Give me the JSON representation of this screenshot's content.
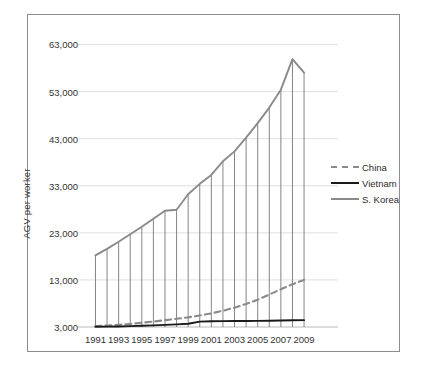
{
  "chart_data": {
    "type": "line",
    "title": "",
    "subtitle": "",
    "xlabel": "",
    "ylabel": "AGV per worker",
    "x": [
      1991,
      1992,
      1993,
      1994,
      1995,
      1996,
      1997,
      1998,
      1999,
      2000,
      2001,
      2002,
      2003,
      2004,
      2005,
      2006,
      2007,
      2008,
      2009
    ],
    "xtick_labels": [
      "1991",
      "1993",
      "1995",
      "1997",
      "1999",
      "2001",
      "2003",
      "2005",
      "2007",
      "2009"
    ],
    "xtick_values": [
      1991,
      1993,
      1995,
      1997,
      1999,
      2001,
      2003,
      2005,
      2007,
      2009
    ],
    "ytick_labels": [
      "3,000",
      "13,000",
      "23,000",
      "33,000",
      "43,000",
      "53,000",
      "63,000"
    ],
    "ytick_values": [
      3000,
      13000,
      23000,
      33000,
      43000,
      53000,
      63000
    ],
    "ylim": [
      3000,
      66500
    ],
    "xlim": [
      1990.4,
      2009.6
    ],
    "grid": "horizontal",
    "legend_position": "right-middle",
    "drop_lines": true,
    "drop_lines_series": "S. Korea",
    "series": [
      {
        "name": "China",
        "style": "dashed",
        "color": "#8a8a8a",
        "values": [
          3200,
          3300,
          3450,
          3650,
          3900,
          4150,
          4450,
          4750,
          5050,
          5450,
          5900,
          6450,
          7100,
          7900,
          8800,
          9900,
          11000,
          12100,
          13000
        ]
      },
      {
        "name": "Vietnam",
        "style": "solid",
        "color": "#1a1a1a",
        "values": [
          3050,
          3080,
          3120,
          3180,
          3260,
          3340,
          3450,
          3560,
          3680,
          4150,
          4220,
          4250,
          4260,
          4270,
          4300,
          4330,
          4380,
          4420,
          4450
        ]
      },
      {
        "name": "S. Korea",
        "style": "solid",
        "color": "#8a8a8a",
        "values": [
          18200,
          19600,
          21100,
          22700,
          24300,
          26000,
          27700,
          27900,
          31200,
          33400,
          35300,
          38200,
          40300,
          43200,
          46300,
          49600,
          53400,
          59900,
          57000
        ]
      }
    ]
  },
  "legend": {
    "items": [
      {
        "label": "China",
        "swatch": "dashed-gray"
      },
      {
        "label": "Vietnam",
        "swatch": "solid-black"
      },
      {
        "label": "S. Korea",
        "swatch": "solid-gray"
      }
    ]
  }
}
